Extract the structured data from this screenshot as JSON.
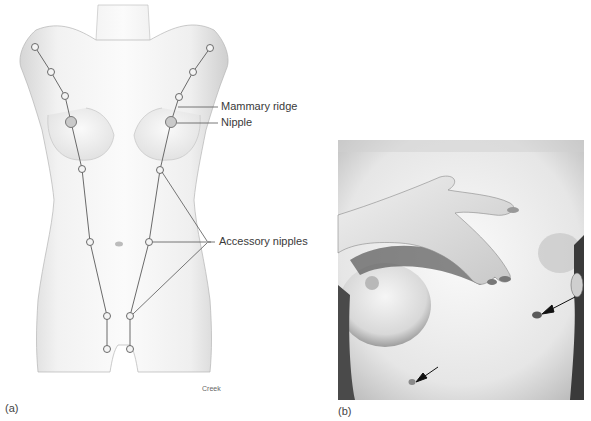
{
  "figure": {
    "panel_a": {
      "sublabel": "(a)",
      "credit": "Creek",
      "labels": {
        "mammary_ridge": "Mammary ridge",
        "nipple": "Nipple",
        "accessory_nipples": "Accessory nipples"
      }
    },
    "panel_b": {
      "sublabel": "(b)"
    }
  }
}
